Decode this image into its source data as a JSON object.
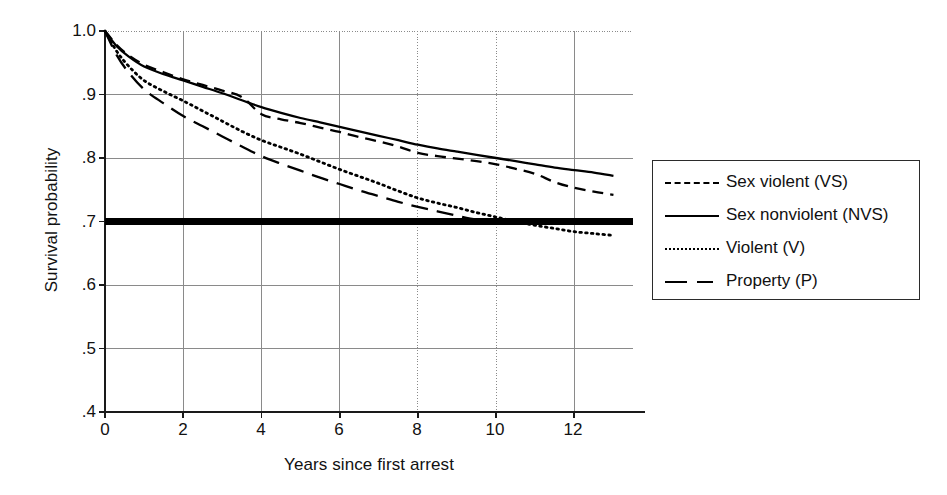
{
  "chart_data": {
    "type": "line",
    "title": "",
    "xlabel": "Years since first arrest",
    "ylabel": "Survival probability",
    "xlim": [
      0,
      13.5
    ],
    "ylim": [
      0.4,
      1.0
    ],
    "xticks": [
      "0",
      "2",
      "4",
      "6",
      "8",
      "10",
      "12"
    ],
    "xtick_values": [
      0,
      2,
      4,
      6,
      8,
      10,
      12
    ],
    "yticks": [
      "1.0",
      ".9",
      ".8",
      ".7",
      ".6",
      ".5",
      ".4"
    ],
    "ytick_values": [
      1.0,
      0.9,
      0.8,
      0.7,
      0.6,
      0.5,
      0.4
    ],
    "grid": true,
    "legend_position": "right-outside",
    "reference_line": {
      "name": "reference-line-070",
      "y": 0.7,
      "style": "thick-solid",
      "color": "#000000",
      "x_from": 0,
      "x_to": 13.5
    },
    "series": [
      {
        "name": "Sex violent (VS)",
        "code": "VS",
        "style": "dashed",
        "color": "#000000",
        "x": [
          0,
          0.3,
          0.6,
          1,
          1.5,
          2,
          2.5,
          3,
          3.5,
          4,
          4.5,
          5,
          5.5,
          6,
          6.5,
          7,
          7.5,
          8,
          8.5,
          9,
          9.5,
          10,
          10.5,
          11,
          11.5,
          12,
          12.5,
          13
        ],
        "y": [
          1.0,
          0.978,
          0.962,
          0.947,
          0.935,
          0.924,
          0.915,
          0.906,
          0.896,
          0.869,
          0.861,
          0.855,
          0.848,
          0.841,
          0.833,
          0.826,
          0.818,
          0.808,
          0.803,
          0.799,
          0.795,
          0.79,
          0.783,
          0.775,
          0.762,
          0.753,
          0.747,
          0.742
        ]
      },
      {
        "name": "Sex nonviolent (NVS)",
        "code": "NVS",
        "style": "solid",
        "color": "#000000",
        "x": [
          0,
          0.3,
          0.6,
          1,
          1.5,
          2,
          2.5,
          3,
          3.5,
          4,
          4.5,
          5,
          5.5,
          6,
          6.5,
          7,
          7.5,
          8,
          8.5,
          9,
          9.5,
          10,
          10.5,
          11,
          11.5,
          12,
          12.5,
          13
        ],
        "y": [
          1.0,
          0.976,
          0.96,
          0.944,
          0.932,
          0.922,
          0.912,
          0.902,
          0.891,
          0.88,
          0.871,
          0.863,
          0.856,
          0.849,
          0.842,
          0.835,
          0.828,
          0.821,
          0.815,
          0.81,
          0.805,
          0.8,
          0.795,
          0.79,
          0.785,
          0.781,
          0.777,
          0.772
        ]
      },
      {
        "name": "Violent (V)",
        "code": "V",
        "style": "dotted",
        "color": "#000000",
        "x": [
          0,
          0.3,
          0.6,
          1,
          1.5,
          2,
          2.5,
          3,
          3.5,
          4,
          4.5,
          5,
          5.5,
          6,
          6.5,
          7,
          7.5,
          8,
          8.5,
          9,
          9.5,
          10,
          10.5,
          11,
          11.5,
          12,
          12.5,
          13
        ],
        "y": [
          1.0,
          0.968,
          0.945,
          0.922,
          0.905,
          0.89,
          0.874,
          0.858,
          0.842,
          0.828,
          0.817,
          0.806,
          0.794,
          0.782,
          0.771,
          0.76,
          0.748,
          0.737,
          0.729,
          0.722,
          0.714,
          0.707,
          0.7,
          0.694,
          0.689,
          0.684,
          0.681,
          0.678
        ]
      },
      {
        "name": "Property (P)",
        "code": "P",
        "style": "long-dash",
        "color": "#000000",
        "x": [
          0,
          0.3,
          0.6,
          1,
          1.5,
          2,
          2.5,
          3,
          3.5,
          4,
          4.5,
          5,
          5.5,
          6,
          6.5,
          7,
          7.5,
          8,
          8.5,
          9,
          9.5,
          10
        ],
        "y": [
          1.0,
          0.962,
          0.935,
          0.908,
          0.886,
          0.866,
          0.85,
          0.834,
          0.818,
          0.803,
          0.791,
          0.78,
          0.769,
          0.759,
          0.749,
          0.74,
          0.731,
          0.723,
          0.716,
          0.709,
          0.703,
          0.7
        ]
      }
    ]
  },
  "axes": {
    "y_title": "Survival probability",
    "x_title": "Years since first arrest",
    "y_tick_labels": [
      "1.0",
      ".9",
      ".8",
      ".7",
      ".6",
      ".5",
      ".4"
    ],
    "x_tick_labels": [
      "0",
      "2",
      "4",
      "6",
      "8",
      "10",
      "12"
    ]
  },
  "legend": {
    "entries": [
      {
        "label": "Sex violent (VS)",
        "style": "dashed"
      },
      {
        "label": "Sex nonviolent (NVS)",
        "style": "solid"
      },
      {
        "label": "Violent (V)",
        "style": "dotted"
      },
      {
        "label": "Property (P)",
        "style": "long-dash"
      }
    ]
  },
  "colors": {
    "line": "#000000",
    "grid": "#8a8a8a",
    "axis": "#1a1a1a",
    "background": "#ffffff"
  }
}
